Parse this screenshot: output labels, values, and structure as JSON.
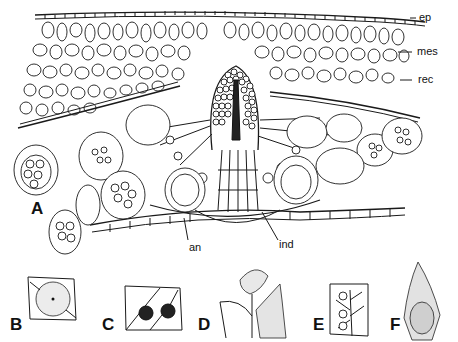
{
  "figure": {
    "main_panel": {
      "label": "A",
      "annotations": [
        {
          "id": "ep",
          "text": "ep"
        },
        {
          "id": "mes",
          "text": "mes"
        },
        {
          "id": "rec",
          "text": "rec"
        },
        {
          "id": "an",
          "text": "an"
        },
        {
          "id": "ind",
          "text": "ind"
        }
      ]
    },
    "sub_panels": [
      {
        "label": "B"
      },
      {
        "label": "C"
      },
      {
        "label": "D"
      },
      {
        "label": "E"
      },
      {
        "label": "F"
      }
    ]
  }
}
